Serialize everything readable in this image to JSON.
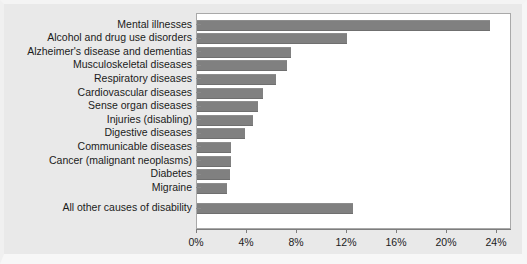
{
  "chart_data": {
    "type": "bar",
    "orientation": "horizontal",
    "title": "",
    "xlabel": "",
    "ylabel": "",
    "xlim": [
      0,
      25.2
    ],
    "grid": false,
    "legend": null,
    "xticks": [
      "0%",
      "4%",
      "8%",
      "12%",
      "16%",
      "20%",
      "24%"
    ],
    "xtick_values": [
      0,
      4,
      8,
      12,
      16,
      20,
      24
    ],
    "categories": [
      "Mental illnesses",
      "Alcohol and drug use disorders",
      "Alzheimer's disease and dementias",
      "Musculoskeletal diseases",
      "Respiratory diseases",
      "Cardiovascular diseases",
      "Sense organ diseases",
      "Injuries (disabling)",
      "Digestive diseases",
      "Communicable diseases",
      "Cancer (malignant neoplasms)",
      "Diabetes",
      "Migraine",
      "All other causes of disability"
    ],
    "values": [
      23.4,
      12.0,
      7.5,
      7.2,
      6.3,
      5.3,
      4.9,
      4.5,
      3.8,
      2.7,
      2.7,
      2.6,
      2.4,
      12.5
    ],
    "value_unit": "%",
    "bar_color": "#808080",
    "plot_background": "#ffffff",
    "figure_background": "#e9e9e9",
    "axis_color": "#7d7d7d",
    "text_color": "#1b1b1b"
  }
}
